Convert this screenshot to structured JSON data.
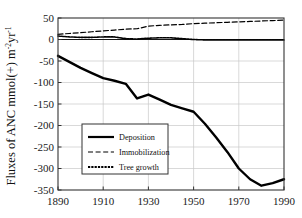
{
  "chart_data": {
    "type": "line",
    "title": "",
    "xlabel": "",
    "ylabel": "Fluxes of ANC mmol(+) m",
    "ylabel_sup1": "-2",
    "ylabel_mid": "yr",
    "ylabel_sup2": "-1",
    "ylabel_full": "Fluxes of ANC mmol(+) m-2yr-1",
    "xlim": [
      1890,
      1990
    ],
    "ylim": [
      -350,
      50
    ],
    "grid": true,
    "legend_position": "center-left",
    "xticks": [
      1890,
      1910,
      1930,
      1950,
      1970,
      1990
    ],
    "xtick_labels": [
      "1890",
      "1910",
      "1930",
      "1950",
      "1970",
      "1990"
    ],
    "yticks": [
      50,
      0,
      -50,
      -100,
      -150,
      -200,
      -250,
      -300,
      -350
    ],
    "ytick_labels": [
      "50",
      "0",
      "-50",
      "-100",
      "-150",
      "-200",
      "-250",
      "-300",
      "-350"
    ],
    "x": [
      1890,
      1895,
      1900,
      1905,
      1910,
      1915,
      1920,
      1925,
      1930,
      1935,
      1940,
      1945,
      1950,
      1955,
      1960,
      1965,
      1970,
      1975,
      1980,
      1985,
      1990
    ],
    "series": [
      {
        "name": "Deposition",
        "style": "solid",
        "color": "#000000",
        "width": 2.4,
        "values": [
          -38,
          -52,
          -66,
          -78,
          -90,
          -96,
          -103,
          -137,
          -128,
          -140,
          -152,
          -160,
          -168,
          -196,
          -228,
          -262,
          -300,
          -325,
          -340,
          -334,
          -325
        ]
      },
      {
        "name": "Immobilization",
        "style": "dashed",
        "color": "#000000",
        "width": 1.2,
        "values": [
          12,
          14,
          16,
          18,
          20,
          22,
          24,
          25,
          31,
          33,
          34,
          35,
          37,
          38,
          39,
          40,
          41,
          42,
          43,
          44,
          45
        ]
      },
      {
        "name": "Tree growth",
        "style": "dotted",
        "color": "#000000",
        "width": 1.6,
        "values": [
          8,
          6,
          5,
          5,
          6,
          6,
          2,
          1,
          3,
          4,
          4,
          2,
          0,
          -1,
          -1,
          -1,
          -1,
          -1,
          -1,
          -1,
          -1
        ]
      }
    ],
    "zero_line": 0
  },
  "legend": {
    "entries": [
      {
        "label": "Deposition",
        "style": "solid"
      },
      {
        "label": "Immobilization",
        "style": "dashed"
      },
      {
        "label": "Tree growth",
        "style": "dotted"
      }
    ]
  },
  "colors": {
    "line": "#000000",
    "grid": "#c8c8c8",
    "frame": "#333333",
    "background": "#ffffff"
  }
}
